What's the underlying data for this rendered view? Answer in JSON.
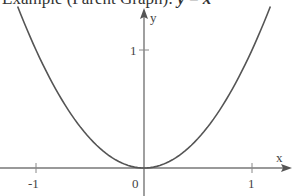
{
  "title": {
    "prefix": "Example (Parent Graph): ",
    "equation": "y = x²"
  },
  "chart_data": {
    "type": "line",
    "title": "Example (Parent Graph): y = x²",
    "function": "y = x^2",
    "xlabel": "x",
    "ylabel": "y",
    "x_ticks": [
      "-1",
      "0",
      "1"
    ],
    "y_ticks": [
      "1"
    ],
    "xlim": [
      -1.33,
      1.39
    ],
    "ylim": [
      -0.24,
      1.42
    ],
    "grid": false,
    "legend": null,
    "series": [
      {
        "name": "y = x²",
        "x": [
          -1.17,
          -1.0,
          -0.75,
          -0.5,
          -0.25,
          0,
          0.25,
          0.5,
          0.75,
          1.0,
          1.17
        ],
        "y": [
          1.37,
          1.0,
          0.5625,
          0.25,
          0.0625,
          0,
          0.0625,
          0.25,
          0.5625,
          1.0,
          1.37
        ]
      }
    ],
    "colors": {
      "curve": "#555555",
      "axes": "#777777"
    }
  },
  "axes": {
    "x_label": "x",
    "y_label": "y",
    "tick_neg1": "-1",
    "tick_zero": "0",
    "tick_pos1": "1",
    "tick_y1": "1"
  }
}
